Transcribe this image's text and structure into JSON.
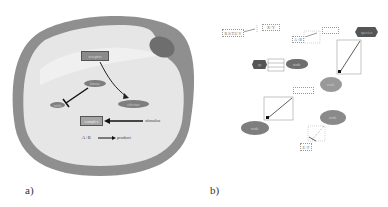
{
  "figure": {
    "panel_a": {
      "label": "a)",
      "description": "Cell illustration with signaling pathway",
      "nodes": {
        "top_box": "receptor",
        "mid_ellipse": "kinase",
        "left_ellipse": "inhib",
        "right_ellipse": "effector",
        "gray_box": "complex",
        "external_label": "stimulus",
        "bottom_left": "A+B",
        "bottom_right": "product"
      }
    },
    "panel_b": {
      "label": "b)",
      "description": "Network layout editor view of the same pathway",
      "nodes": {
        "top_left_box": "R.S.T.U.V",
        "top_small_box": "X+Y",
        "mid_small": "A+B",
        "hex_top_right": "species",
        "hex_left": "sp",
        "ellipse_left_mid": "node",
        "ellipse_right_1": "node",
        "ellipse_right_2": "node",
        "ellipse_bottom_left": "node",
        "bottom_small": "E+F"
      }
    },
    "colors": {
      "cell_membrane": "#8f8f8f",
      "cell_interior": "#e6e6e6",
      "nucleus": "#6e6e6e",
      "node_fill": "#7e7e7e",
      "hex_fill": "#555555"
    }
  }
}
